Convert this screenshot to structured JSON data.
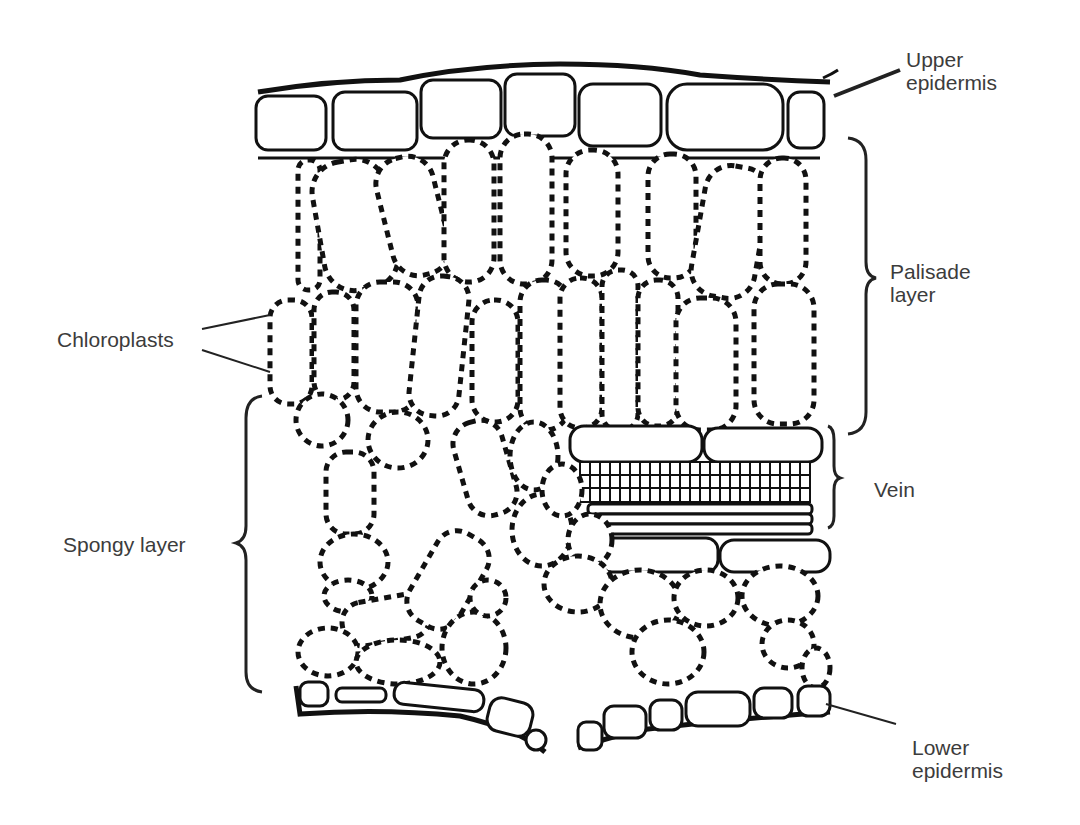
{
  "diagram": {
    "labels": {
      "upper_epidermis": [
        "Upper",
        "epidermis"
      ],
      "palisade_layer": [
        "Palisade",
        "layer"
      ],
      "chloroplasts": "Chloroplasts",
      "vein": "Vein",
      "spongy_layer": "Spongy layer",
      "lower_epidermis": [
        "Lower",
        "epidermis"
      ]
    },
    "colors": {
      "ink": "#111111",
      "label_text": "#3c3c3c",
      "background": "#ffffff"
    }
  }
}
